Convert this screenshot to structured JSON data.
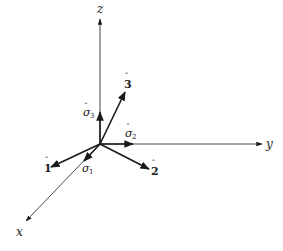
{
  "diagram": {
    "type": "3d-coordinate-axes-with-basis-vectors",
    "origin": {
      "x": 100,
      "y": 144
    },
    "axes": [
      {
        "name": "z",
        "label": "z",
        "end": {
          "x": 100,
          "y": 18
        },
        "label_pos": {
          "x": 100,
          "y": 12
        }
      },
      {
        "name": "y",
        "label": "y",
        "end": {
          "x": 262,
          "y": 144
        },
        "label_pos": {
          "x": 270,
          "y": 148
        }
      },
      {
        "name": "x",
        "label": "x",
        "end": {
          "x": 25,
          "y": 222
        },
        "label_pos": {
          "x": 20,
          "y": 236
        }
      }
    ],
    "vectors": [
      {
        "name": "e3",
        "label": "3",
        "hat": true,
        "end": {
          "x": 125,
          "y": 92
        },
        "label_pos": {
          "x": 127,
          "y": 88
        }
      },
      {
        "name": "sigma3",
        "label": "σ",
        "sub": "3",
        "hat": true,
        "end": {
          "x": 100,
          "y": 112
        },
        "label_pos": {
          "x": 84,
          "y": 116
        }
      },
      {
        "name": "sigma2",
        "label": "σ",
        "sub": "2",
        "hat": true,
        "end": {
          "x": 133,
          "y": 144
        },
        "label_pos": {
          "x": 125,
          "y": 133
        }
      },
      {
        "name": "e2",
        "label": "2",
        "hat": true,
        "end": {
          "x": 149,
          "y": 169
        },
        "label_pos": {
          "x": 152,
          "y": 174
        }
      },
      {
        "name": "e1",
        "label": "1",
        "hat": true,
        "end": {
          "x": 51,
          "y": 167
        },
        "label_pos": {
          "x": 42,
          "y": 172
        }
      },
      {
        "name": "sigma1",
        "label": "σ",
        "sub": "1",
        "hat": true,
        "end": {
          "x": 84,
          "y": 161
        },
        "label_pos": {
          "x": 84,
          "y": 172
        }
      }
    ],
    "colors": {
      "ink": "#1a1a1a",
      "thin_axis": "#333333",
      "background": "#ffffff"
    }
  }
}
